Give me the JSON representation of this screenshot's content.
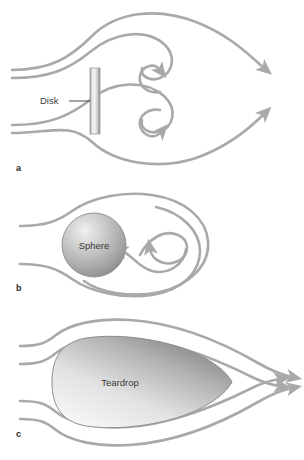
{
  "figure": {
    "width": 304,
    "height": 460,
    "background": "#ffffff",
    "streamline_color": "#a9a9a9",
    "streamline_width": 2.6,
    "label_color": "#3a3a3a"
  },
  "panels": [
    {
      "id": "a",
      "label": "a",
      "object_label": "Disk",
      "leader_label": "Disk",
      "description": "Flow past a flat disk with two recirculating vortices in the wake",
      "object_fill_light": "#f2f2f2",
      "object_fill_dark": "#9a9a9a",
      "vortices": 2,
      "inlet_streamlines": 4,
      "outlet_arrows": 2
    },
    {
      "id": "b",
      "label": "b",
      "object_label": "Sphere",
      "description": "Flow past a sphere with a closed recirculation loop in the wake",
      "object_fill_light": "#e8e8e8",
      "object_fill_dark": "#8e8e8e",
      "vortices": 1,
      "inlet_streamlines": 2,
      "outlet_arrows": 2
    },
    {
      "id": "c",
      "label": "c",
      "object_label": "Teardrop",
      "description": "Streamlined flow past a teardrop body with attached streamlines",
      "object_fill_light": "#efefef",
      "object_fill_dark": "#8a8a8a",
      "vortices": 0,
      "inlet_streamlines": 4,
      "outlet_arrows": 4
    }
  ]
}
